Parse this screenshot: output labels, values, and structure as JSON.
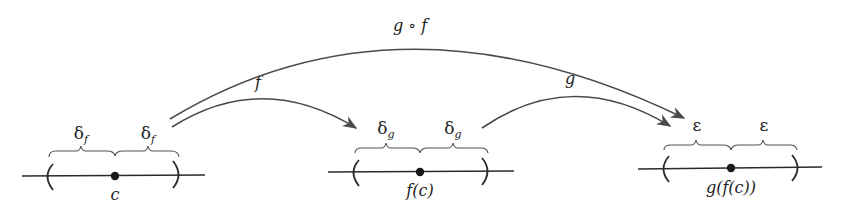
{
  "diagram": {
    "arrows": {
      "f": {
        "label": "f"
      },
      "g": {
        "label": "g"
      },
      "composite": {
        "label": "g ∘ f"
      }
    },
    "number_lines": [
      {
        "point_label": "c",
        "left_radius": {
          "symbol": "δ",
          "subscript": "f"
        },
        "right_radius": {
          "symbol": "δ",
          "subscript": "f"
        }
      },
      {
        "point_label": "f(c)",
        "left_radius": {
          "symbol": "δ",
          "subscript": "g"
        },
        "right_radius": {
          "symbol": "δ",
          "subscript": "g"
        }
      },
      {
        "point_label": "g(f(c))",
        "left_radius": {
          "symbol": "ε",
          "subscript": ""
        },
        "right_radius": {
          "symbol": "ε",
          "subscript": ""
        }
      }
    ]
  },
  "colors": {
    "line": "#2a2a2a",
    "arrow": "#4a4a4a",
    "text": "#222222",
    "background": "#ffffff"
  }
}
